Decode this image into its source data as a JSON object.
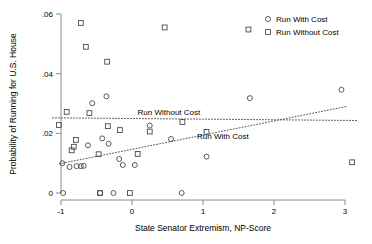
{
  "chart_data": {
    "type": "scatter",
    "title": "",
    "xlabel": "State Senator Extremism, NP-Score",
    "ylabel": "Probability of Running for U.S. House",
    "xlim": [
      -1.15,
      3.2
    ],
    "ylim": [
      0,
      0.06
    ],
    "xticks": [
      "-1",
      "0",
      "1",
      "2",
      "3"
    ],
    "xtick_values": [
      -1,
      0,
      1,
      2,
      3
    ],
    "yticks": [
      "0",
      ".02",
      ".04",
      ".06"
    ],
    "ytick_values": [
      0,
      0.02,
      0.04,
      0.06
    ],
    "grid": false,
    "legend_position": "top-right",
    "series": [
      {
        "name": "Run With Cost",
        "marker": "circle",
        "color": "#4a4a4a",
        "points": [
          [
            -0.98,
            0.01
          ],
          [
            -0.97,
            0.0
          ],
          [
            -0.88,
            0.0087
          ],
          [
            -0.78,
            0.009
          ],
          [
            -0.72,
            0.009
          ],
          [
            -0.68,
            0.0091
          ],
          [
            -0.62,
            0.016
          ],
          [
            -0.56,
            0.0301
          ],
          [
            -0.45,
            0.0
          ],
          [
            -0.42,
            0.0183
          ],
          [
            -0.36,
            0.0324
          ],
          [
            -0.33,
            0.0165
          ],
          [
            -0.26,
            0.0
          ],
          [
            -0.18,
            0.0114
          ],
          [
            -0.13,
            0.0094
          ],
          [
            0.04,
            0.0094
          ],
          [
            0.25,
            0.0226
          ],
          [
            0.55,
            0.0181
          ],
          [
            0.7,
            0.0
          ],
          [
            1.05,
            0.0122
          ],
          [
            1.66,
            0.0318
          ],
          [
            2.95,
            0.0346
          ]
        ]
      },
      {
        "name": "Run Without Cost",
        "marker": "square",
        "color": "#4a4a4a",
        "points": [
          [
            -1.03,
            0.0228
          ],
          [
            -0.92,
            0.0272
          ],
          [
            -0.85,
            0.0143
          ],
          [
            -0.82,
            0.0155
          ],
          [
            -0.79,
            0.0178
          ],
          [
            -0.72,
            0.057
          ],
          [
            -0.65,
            0.049
          ],
          [
            -0.6,
            0.0268
          ],
          [
            -0.47,
            0.013
          ],
          [
            -0.45,
            0.0
          ],
          [
            -0.35,
            0.044
          ],
          [
            -0.34,
            0.0224
          ],
          [
            -0.17,
            0.0211
          ],
          [
            -0.03,
            0.0
          ],
          [
            0.08,
            0.0131
          ],
          [
            0.25,
            0.0206
          ],
          [
            0.46,
            0.0555
          ],
          [
            0.71,
            0.0238
          ],
          [
            1.05,
            0.0205
          ],
          [
            1.64,
            0.0548
          ],
          [
            3.1,
            0.0103
          ]
        ]
      }
    ],
    "fit_lines": [
      {
        "name": "Run With Cost",
        "style": "dotted",
        "x_start": -1.02,
        "y_start": 0.0098,
        "x_end": 3.02,
        "y_end": 0.029
      },
      {
        "name": "Run Without Cost",
        "style": "dotted",
        "x_start": -1.12,
        "y_start": 0.0252,
        "x_end": 3.18,
        "y_end": 0.0243
      }
    ],
    "annotations": [
      {
        "text": "Run Without Cost",
        "x": 0.52,
        "y": 0.0262
      },
      {
        "text": "Run With Cost",
        "x": 1.28,
        "y": 0.0182
      }
    ],
    "legend": [
      {
        "label": "Run With Cost",
        "marker": "circle"
      },
      {
        "label": "Run Without Cost",
        "marker": "square"
      }
    ]
  }
}
